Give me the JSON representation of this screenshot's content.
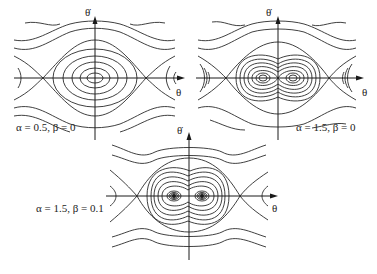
{
  "figure": {
    "panels": [
      {
        "id": "panel-1",
        "caption": "α = 0.5, β = 0",
        "x_axis_label": "θ",
        "y_axis_label": "θ̇",
        "center": [
          95,
          78
        ],
        "fixed_points": {
          "centers": [
            [
              95,
              78
            ]
          ],
          "saddles": [
            [
              43,
              78
            ],
            [
              146,
              78
            ]
          ]
        }
      },
      {
        "id": "panel-2",
        "caption": "α = 1.5, β = 0",
        "x_axis_label": "θ",
        "y_axis_label": "θ̇",
        "center": [
          278,
          78
        ],
        "fixed_points": {
          "centers": [
            [
              263,
              78
            ],
            [
              293,
              78
            ]
          ],
          "saddles": [
            [
              226,
              78
            ],
            [
              329,
              78
            ]
          ]
        }
      },
      {
        "id": "panel-3",
        "caption": "α = 1.5, β = 0.1",
        "x_axis_label": "θ",
        "y_axis_label": "θ̇",
        "center": [
          189,
          196
        ],
        "fixed_points": {
          "spirals": [
            [
              174,
              196
            ],
            [
              202,
              196
            ]
          ],
          "saddles": [
            [
              137,
              196
            ],
            [
              240,
              196
            ]
          ]
        }
      }
    ]
  }
}
